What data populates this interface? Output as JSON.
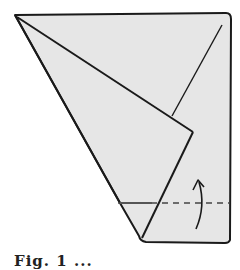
{
  "figure": {
    "colors": {
      "paper_fill": "#e6e6e6",
      "outline": "#1a1a1a",
      "dashed_line": "#444444",
      "background": "#ffffff"
    },
    "caption": "Fig. 1 ..."
  }
}
